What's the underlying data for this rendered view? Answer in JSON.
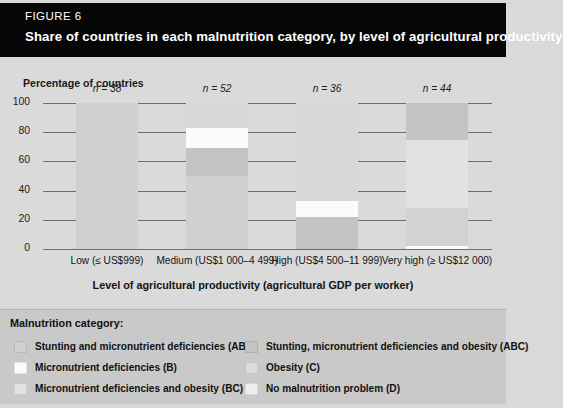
{
  "header": {
    "figure_label": "FIGURE 6",
    "title": "Share of countries in each malnutrition category, by level of agricultural productivity",
    "background_color": "#060606",
    "text_color": "#ffffff"
  },
  "axes": {
    "y_axis_title": "Percentage of countries",
    "x_axis_title": "Level of agricultural productivity (agricultural GDP per worker)"
  },
  "legend": {
    "title": "Malnutrition category:",
    "left_items": [
      {
        "label": "Stunting and micronutrient deficiencies (AB)",
        "color": "#d0d0d0"
      },
      {
        "label": "Micronutrient deficiencies (B)",
        "color": "#fbfbfb"
      },
      {
        "label": "Micronutrient deficiencies and obesity (BC)",
        "color": "#e2e2e2"
      }
    ],
    "right_items": [
      {
        "label": "Stunting, micronutrient deficiencies and obesity (ABC)",
        "color": "#c3c3c3"
      },
      {
        "label": "Obesity (C)",
        "color": "#dcdcdc"
      },
      {
        "label": "No malnutrition problem (D)",
        "color": "#eeeeee"
      }
    ]
  },
  "chart_data": {
    "type": "bar",
    "subtype": "stacked-bar",
    "title": "Share of countries in each malnutrition category, by level of agricultural productivity",
    "xlabel": "Level of agricultural productivity (agricultural GDP per worker)",
    "ylabel": "Percentage of countries",
    "ylim": [
      0,
      100
    ],
    "yticks": [
      0,
      20,
      40,
      60,
      80,
      100
    ],
    "grid": true,
    "legend_position": "bottom",
    "categories": [
      "Low (≤ US$999)",
      "Medium (US$1 000–4 499)",
      "High (US$4 500–11 999)",
      "Very high (≥ US$12 000)"
    ],
    "category_counts": [
      "n = 38",
      "n = 52",
      "n = 36",
      "n = 44"
    ],
    "series": [
      {
        "name": "Stunting and micronutrient deficiencies (AB)",
        "color": "#d0d0d0",
        "values": [
          100,
          50,
          0,
          0
        ]
      },
      {
        "name": "Micronutrient deficiencies (B)",
        "color": "#fbfbfb",
        "values": [
          0,
          0,
          22,
          0
        ]
      },
      {
        "name": "Micronutrient deficiencies and obesity (BC)",
        "color": "#e2e2e2",
        "values": [
          0,
          0,
          0,
          26
        ]
      },
      {
        "name": "Stunting, micronutrient deficiencies and obesity (ABC)",
        "color": "#c3c3c3",
        "values": [
          0,
          19,
          0,
          47
        ]
      },
      {
        "name": "Obesity (C)",
        "color": "#dcdcdc",
        "values": [
          0,
          14,
          11,
          25
        ]
      },
      {
        "name": "No malnutrition problem (D)",
        "color": "#eeeeee",
        "values": [
          0,
          17,
          67,
          2
        ]
      }
    ],
    "stacks": [
      {
        "category": "Low (≤ US$999)",
        "n": 38,
        "segments": [
          {
            "label": "Stunting and micronutrient deficiencies (AB)",
            "from": 0,
            "to": 100,
            "value": 100,
            "color": "#d0d0d0"
          }
        ]
      },
      {
        "category": "Medium (US$1 000–4 499)",
        "n": 52,
        "segments": [
          {
            "label": "Stunting and micronutrient deficiencies (AB)",
            "from": 0,
            "to": 50,
            "value": 50,
            "color": "#d0d0d0"
          },
          {
            "label": "Stunting, micronutrient deficiencies and obesity (ABC)",
            "from": 50,
            "to": 69,
            "value": 19,
            "color": "#c3c3c3"
          },
          {
            "label": "Obesity (C)",
            "from": 69,
            "to": 83,
            "value": 14,
            "color": "#fbfbfb"
          },
          {
            "label": "No malnutrition problem (D)",
            "from": 83,
            "to": 100,
            "value": 17,
            "color": "#d8d8d8"
          }
        ]
      },
      {
        "category": "High (US$4 500–11 999)",
        "n": 36,
        "segments": [
          {
            "label": "Micronutrient deficiencies and obesity (BC)",
            "from": 0,
            "to": 22,
            "value": 22,
            "color": "#c3c3c3"
          },
          {
            "label": "Obesity (C)",
            "from": 22,
            "to": 33,
            "value": 11,
            "color": "#fbfbfb"
          },
          {
            "label": "No malnutrition problem (D)",
            "from": 33,
            "to": 100,
            "value": 67,
            "color": "#d8d8d8"
          }
        ]
      },
      {
        "category": "Very high (≥ US$12 000)",
        "n": 44,
        "segments": [
          {
            "label": "Micronutrient deficiencies (B)",
            "from": 0,
            "to": 2,
            "value": 2,
            "color": "#fbfbfb"
          },
          {
            "label": "Micronutrient deficiencies and obesity (BC)",
            "from": 2,
            "to": 28,
            "value": 26,
            "color": "#d2d2d2"
          },
          {
            "label": "No malnutrition problem (D)",
            "from": 28,
            "to": 75,
            "value": 47,
            "color": "#e2e2e2"
          },
          {
            "label": "Stunting, micronutrient deficiencies and obesity (ABC)",
            "from": 75,
            "to": 100,
            "value": 25,
            "color": "#c3c3c3"
          }
        ]
      }
    ]
  }
}
